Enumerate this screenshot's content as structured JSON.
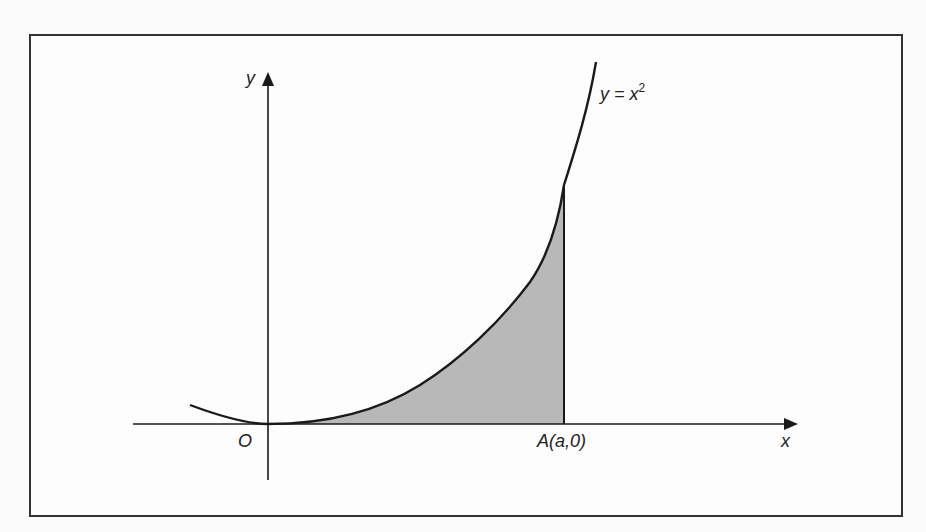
{
  "figure": {
    "curve_label": "y = x",
    "curve_exponent": "2",
    "y_axis_label": "y",
    "x_axis_label": "x",
    "origin_label": "O",
    "point_a_label": "A(a,0)",
    "shade_color": "#b8b8b8",
    "line_color": "#1a1a1a"
  }
}
